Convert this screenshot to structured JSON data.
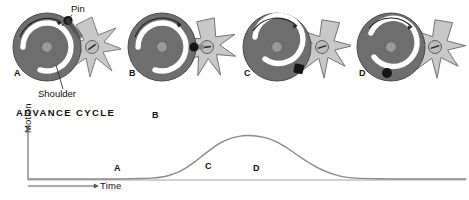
{
  "figure": {
    "callouts": [
      {
        "id": "pin",
        "label": "Pin"
      },
      {
        "id": "shoulder",
        "label": "Shoulder"
      }
    ],
    "stages": [
      {
        "letter": "A",
        "pin_angle_deg": -52,
        "star_rotation_deg": 0,
        "name": "stage-a"
      },
      {
        "letter": "B",
        "pin_angle_deg": 0,
        "star_rotation_deg": 14,
        "name": "stage-b"
      },
      {
        "letter": "C",
        "pin_angle_deg": 52,
        "star_rotation_deg": 36,
        "name": "stage-c"
      },
      {
        "letter": "D",
        "pin_angle_deg": 95,
        "star_rotation_deg": 36,
        "name": "stage-d"
      }
    ],
    "colors": {
      "disc": "#6e6e6e",
      "disc_edge": "#4a4a4a",
      "groove": "#ffffff",
      "hub": "#9a9a9a",
      "star": "#c8c8c8",
      "star_edge": "#707070",
      "pin": "#151515",
      "curve": "#8a8a8a",
      "axis": "#555555",
      "text": "#111111"
    }
  },
  "chart_data": {
    "type": "line",
    "title": "ADVANCE CYCLE",
    "xlabel": "Time",
    "ylabel": "Motion",
    "grid": false,
    "legend": null,
    "xlim": [
      0,
      100
    ],
    "ylim": [
      0,
      1
    ],
    "x": [
      0,
      5,
      10,
      15,
      20,
      25,
      28,
      30,
      32,
      34,
      36,
      38,
      40,
      42,
      44,
      46,
      48,
      50,
      52,
      54,
      56,
      58,
      60,
      62,
      64,
      66,
      68,
      70,
      72,
      75,
      80,
      85,
      90,
      95,
      100
    ],
    "values": [
      0,
      0,
      0,
      0,
      0,
      0.01,
      0.02,
      0.04,
      0.08,
      0.15,
      0.26,
      0.4,
      0.56,
      0.71,
      0.84,
      0.93,
      0.98,
      1.0,
      0.99,
      0.95,
      0.88,
      0.78,
      0.65,
      0.51,
      0.38,
      0.26,
      0.17,
      0.1,
      0.05,
      0.02,
      0.005,
      0,
      0,
      0,
      0
    ],
    "annotations": [
      {
        "label": "A",
        "x": 25,
        "y": 0.08,
        "note": "start of advance"
      },
      {
        "label": "B",
        "x": 50,
        "y": 1.12,
        "note": "peak motion"
      },
      {
        "label": "C",
        "x": 72,
        "y": 0.1,
        "note": "end of advance"
      },
      {
        "label": "D",
        "x": 88,
        "y": 0.1,
        "note": "dwell"
      }
    ]
  }
}
